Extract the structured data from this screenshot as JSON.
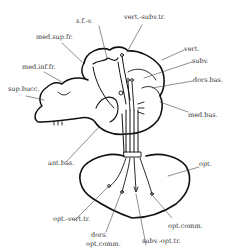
{
  "diagram": {
    "type": "anatomical-diagram",
    "labels": {
      "sfv": "s.f.-v.",
      "vert_subv_tr": "vert.-subv.tr.",
      "med_sup_fr": "med.sup.fr.",
      "vert": "vert.",
      "subv": "subv.",
      "med_inf_fr": "med.inf.fr.",
      "dors_bas": "dors.bas.",
      "sup_bucc": "sup.bucc.",
      "med_bas": "med.bas.",
      "ant_bas": "ant.bas.",
      "opt": "opt.",
      "opt_vert_tr": "opt.-vert.tr.",
      "opt_comm": "opt.comm.",
      "dors_opt_comm_1": "dors.",
      "dors_opt_comm_2": "opt.comm.",
      "subv_opt_tr": "subv.-opt.tr."
    },
    "colors": {
      "line": "#111111",
      "leader": "#444444",
      "background": "#ffffff"
    }
  }
}
